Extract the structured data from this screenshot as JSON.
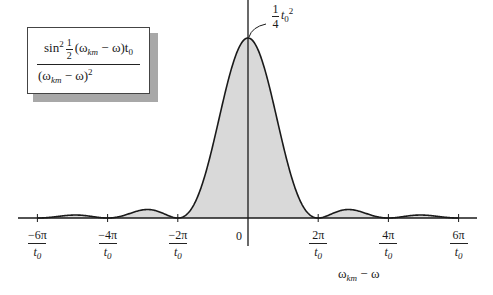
{
  "chart_data": {
    "type": "area",
    "title": "",
    "function": "sin^2(1/2 (ω_km − ω) t0) / (ω_km − ω)^2",
    "formula_box": {
      "numerator_prefix": "sin",
      "numerator_power": "2",
      "half_num": "1",
      "half_den": "2",
      "numerator_rest": "(ω",
      "numerator_sub": "km",
      "numerator_tail": " − ω)t",
      "numerator_t_sub": "0",
      "denominator_open": "(ω",
      "denominator_sub": "km",
      "denominator_tail": " − ω)",
      "denominator_power": "2"
    },
    "peak_annotation": {
      "frac_num": "1",
      "frac_den": "4",
      "t": "t",
      "t_sub": "0",
      "power": "2",
      "value_label": "1/4 t0^2"
    },
    "xlabel": {
      "main": "ω",
      "sub": "km",
      "tail": " − ω"
    },
    "ylabel": "",
    "x_range_units": "π/t0",
    "xlim": [
      -6.6,
      6.6
    ],
    "ylim": [
      0,
      1.0
    ],
    "grid": false,
    "legend": null,
    "x_ticks": [
      {
        "num": "−6π",
        "den": "t0",
        "value": -6
      },
      {
        "num": "−4π",
        "den": "t0",
        "value": -4
      },
      {
        "num": "−2π",
        "den": "t0",
        "value": -2
      },
      {
        "num": "0",
        "den": "",
        "value": 0
      },
      {
        "num": "2π",
        "den": "t0",
        "value": 2
      },
      {
        "num": "4π",
        "den": "t0",
        "value": 4
      },
      {
        "num": "6π",
        "den": "t0",
        "value": 6
      }
    ],
    "zeros_at": [
      -6,
      -4,
      -2,
      2,
      4,
      6
    ],
    "main_lobe_peak": {
      "x": 0,
      "y_relative": 1.0
    },
    "side_lobes": [
      {
        "x_center": -3,
        "y_relative": 0.045
      },
      {
        "x_center": -5,
        "y_relative": 0.016
      },
      {
        "x_center": 3,
        "y_relative": 0.045
      },
      {
        "x_center": 5,
        "y_relative": 0.016
      }
    ],
    "fill_color": "#d9d9d9",
    "line_color": "#1a1a1a"
  }
}
